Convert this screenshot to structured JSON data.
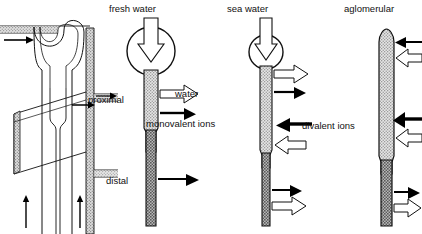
{
  "figure": {
    "name": "comparative-nephron-diagram",
    "background_color": "#ffffff",
    "line_color": "#111111",
    "proximal_fill": "#d8d8d8",
    "distal_fill": "#9a9a9a",
    "solid_arrow_color": "#000000",
    "open_arrow_fill": "#ffffff"
  },
  "panels": [
    {
      "id": "cutaway",
      "title": "",
      "type": "tubule-cutaway",
      "arrows": [
        {
          "id": "inflow-arrow",
          "label": "",
          "style": "solid",
          "direction": "right"
        },
        {
          "id": "outflow-arrow-upper",
          "label": "",
          "style": "solid",
          "direction": "right"
        },
        {
          "id": "upflow-arrow-left",
          "label": "",
          "style": "solid",
          "direction": "up"
        },
        {
          "id": "upflow-arrow-right",
          "label": "",
          "style": "solid",
          "direction": "up"
        }
      ]
    },
    {
      "id": "fresh-water",
      "title": "fresh water",
      "type": "glomerular-nephron",
      "glomerulus": "large",
      "segments": [
        {
          "id": "proximal",
          "label": "proximal",
          "fill": "#d8d8d8"
        },
        {
          "id": "distal",
          "label": "distal",
          "fill": "#9a9a9a"
        }
      ],
      "arrows": [
        {
          "id": "filtration-arrow",
          "label": "fresh water",
          "style": "open",
          "direction": "down"
        },
        {
          "id": "water-arrow",
          "label": "water",
          "style": "open",
          "direction": "right"
        },
        {
          "id": "monovalent-ions-arrow",
          "label": "monovalent ions",
          "style": "solid",
          "direction": "right"
        },
        {
          "id": "distal-outflow-arrow",
          "label": "",
          "style": "solid",
          "direction": "right"
        }
      ]
    },
    {
      "id": "sea-water",
      "title": "sea water",
      "type": "glomerular-nephron",
      "glomerulus": "small",
      "segments": [
        {
          "id": "proximal",
          "label": "",
          "fill": "#d8d8d8"
        },
        {
          "id": "distal",
          "label": "",
          "fill": "#9a9a9a"
        }
      ],
      "arrows": [
        {
          "id": "filtration-arrow",
          "label": "sea water",
          "style": "open",
          "direction": "down"
        },
        {
          "id": "water-out-arrow",
          "label": "",
          "style": "open",
          "direction": "right"
        },
        {
          "id": "ions-out-arrow",
          "label": "",
          "style": "solid",
          "direction": "right"
        },
        {
          "id": "divalent-ions-arrow",
          "label": "divalent ions",
          "style": "solid",
          "direction": "left"
        },
        {
          "id": "water-in-arrow",
          "label": "",
          "style": "open",
          "direction": "left"
        },
        {
          "id": "distal-solid-arrow",
          "label": "",
          "style": "solid",
          "direction": "right"
        },
        {
          "id": "distal-open-arrow",
          "label": "",
          "style": "open",
          "direction": "right"
        }
      ]
    },
    {
      "id": "aglomerular",
      "title": "aglomerular",
      "type": "aglomerular-nephron",
      "glomerulus": "none",
      "segments": [
        {
          "id": "proximal",
          "label": "",
          "fill": "#d8d8d8"
        },
        {
          "id": "distal",
          "label": "",
          "fill": "#9a9a9a"
        }
      ],
      "arrows": [
        {
          "id": "top-solid-arrow",
          "label": "",
          "style": "solid",
          "direction": "left"
        },
        {
          "id": "top-open-arrow",
          "label": "",
          "style": "open",
          "direction": "left"
        },
        {
          "id": "mid-solid-arrow",
          "label": "",
          "style": "solid",
          "direction": "left"
        },
        {
          "id": "mid-open-arrow",
          "label": "",
          "style": "open",
          "direction": "left"
        },
        {
          "id": "distal-solid-arrow",
          "label": "",
          "style": "solid",
          "direction": "right"
        },
        {
          "id": "distal-open-arrow",
          "label": "",
          "style": "open",
          "direction": "right"
        }
      ]
    }
  ],
  "labels": {
    "fresh_water": "fresh water",
    "sea_water": "sea water",
    "aglomerular": "aglomerular",
    "proximal": "proximal",
    "distal": "distal",
    "water": "water",
    "monovalent_ions": "monovalent ions",
    "divalent_ions": "divalent ions"
  }
}
